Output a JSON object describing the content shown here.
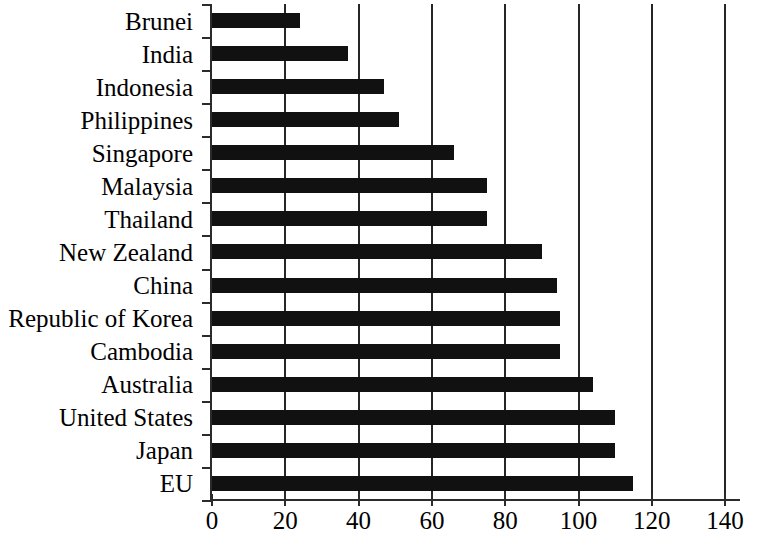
{
  "chart_data": {
    "type": "bar",
    "orientation": "horizontal",
    "title": "",
    "subtitle": "",
    "xlabel": "",
    "ylabel": "",
    "xlim": [
      0,
      144
    ],
    "ylim": null,
    "grid": "vertical gridlines at every x tick except 0",
    "legend": null,
    "xticks": [
      0,
      20,
      40,
      60,
      80,
      100,
      120,
      140
    ],
    "xtick_labels": [
      "0",
      "20",
      "40",
      "60",
      "80",
      "100",
      "120",
      "140"
    ],
    "categories": [
      "Brunei",
      "India",
      "Indonesia",
      "Philippines",
      "Singapore",
      "Malaysia",
      "Thailand",
      "New Zealand",
      "China",
      "Republic of Korea",
      "Cambodia",
      "Australia",
      "United States",
      "Japan",
      "EU"
    ],
    "values": [
      24,
      37,
      47,
      51,
      66,
      75,
      75,
      90,
      94,
      95,
      95,
      104,
      110,
      110,
      115
    ],
    "bar_color": "#111111",
    "axis_color": "#2b2b2b",
    "background_color": "#ffffff"
  }
}
